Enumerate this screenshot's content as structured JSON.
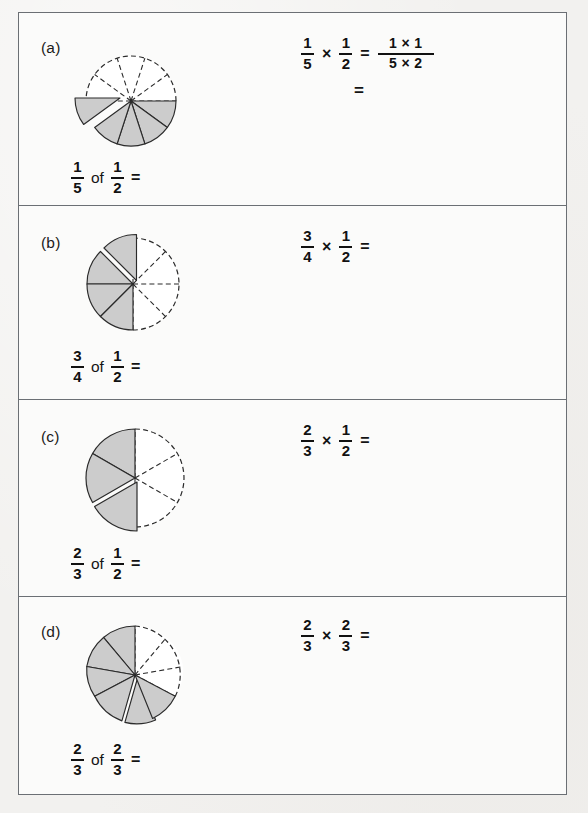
{
  "worksheet": {
    "style": {
      "paper_color": "#f2f1ef",
      "sheet_color": "#fbfbfa",
      "border_color": "#6b6f74",
      "pie_shaded_color": "#cccccc",
      "pie_unshaded_color": "#ffffff",
      "pie_outline_color": "#2b2b2b",
      "text_color": "#111111"
    },
    "items": [
      {
        "label": "(a)",
        "bottom_expression": {
          "left_fraction": {
            "numerator": "1",
            "denominator": "5"
          },
          "connector": "of",
          "right_fraction": {
            "numerator": "1",
            "denominator": "2"
          },
          "equals": "="
        },
        "right_expression": {
          "first_fraction": {
            "numerator": "1",
            "denominator": "5"
          },
          "times": "×",
          "second_fraction": {
            "numerator": "1",
            "denominator": "2"
          },
          "equals": "=",
          "result_fraction": {
            "numerator": "1 × 1",
            "denominator": "5 × 2"
          },
          "second_line_equals": "="
        },
        "pie": {
          "total_sectors": 10,
          "shaded_sectors": 5,
          "exploded_sectors": 1,
          "shaded_half": "bottom",
          "description": "Circle split into 10 equal sectors; the bottom half (5 sectors) is shaded grey and one of those shaded sectors is pulled out to the left."
        }
      },
      {
        "label": "(b)",
        "bottom_expression": {
          "left_fraction": {
            "numerator": "3",
            "denominator": "4"
          },
          "connector": "of",
          "right_fraction": {
            "numerator": "1",
            "denominator": "2"
          },
          "equals": "="
        },
        "right_expression": {
          "first_fraction": {
            "numerator": "3",
            "denominator": "4"
          },
          "times": "×",
          "second_fraction": {
            "numerator": "1",
            "denominator": "2"
          },
          "equals": "="
        },
        "pie": {
          "total_sectors": 8,
          "shaded_sectors": 3,
          "exploded_sectors": 1,
          "shaded_half": "left",
          "description": "Circle split into 8 equal sectors; 3 sectors of the left half are shaded grey with a white gap separating the top shaded sector."
        }
      },
      {
        "label": "(c)",
        "bottom_expression": {
          "left_fraction": {
            "numerator": "2",
            "denominator": "3"
          },
          "connector": "of",
          "right_fraction": {
            "numerator": "1",
            "denominator": "2"
          },
          "equals": "="
        },
        "right_expression": {
          "first_fraction": {
            "numerator": "2",
            "denominator": "3"
          },
          "times": "×",
          "second_fraction": {
            "numerator": "1",
            "denominator": "2"
          },
          "equals": "="
        },
        "pie": {
          "total_sectors": 6,
          "shaded_sectors": 2,
          "exploded_sectors": 1,
          "shaded_half": "left",
          "description": "Circle split into 6 equal sectors; 2 sectors of the left half are shaded grey with a white gap between them."
        }
      },
      {
        "label": "(d)",
        "bottom_expression": {
          "left_fraction": {
            "numerator": "2",
            "denominator": "3"
          },
          "connector": "of",
          "right_fraction": {
            "numerator": "2",
            "denominator": "3"
          },
          "equals": "="
        },
        "right_expression": {
          "first_fraction": {
            "numerator": "2",
            "denominator": "3"
          },
          "times": "×",
          "second_fraction": {
            "numerator": "2",
            "denominator": "3"
          },
          "equals": "="
        },
        "pie": {
          "total_sectors": 9,
          "shaded_sectors": 6,
          "exploded_sectors": 1,
          "shaded_half": "left",
          "description": "Circle split into 9 equal sectors; 6 sectors are shaded grey with a thin white gap near the lower-left."
        }
      }
    ]
  }
}
